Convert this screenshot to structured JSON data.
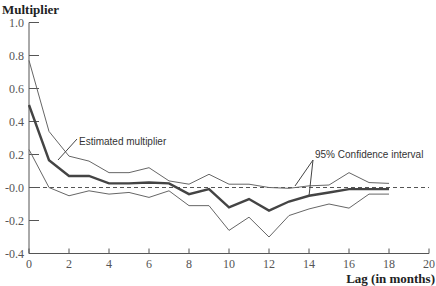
{
  "chart_data": {
    "type": "line",
    "title": "",
    "ylabel": "Multiplier",
    "xlabel": "Lag (in months)",
    "xlim": [
      0,
      20
    ],
    "ylim": [
      -0.4,
      1.0
    ],
    "x_ticks": [
      0,
      2,
      4,
      6,
      8,
      10,
      12,
      14,
      16,
      18,
      20
    ],
    "y_ticks": [
      "1.0",
      "0.8",
      "0.6",
      "0.4",
      "0.2",
      "-0.0",
      "-0.2",
      "-0.4"
    ],
    "grid": false,
    "reference_line": {
      "y": 0.0,
      "style": "dashed"
    },
    "x": [
      0,
      1,
      2,
      3,
      4,
      5,
      6,
      7,
      8,
      9,
      10,
      11,
      12,
      13,
      14,
      15,
      16,
      17,
      18
    ],
    "series": [
      {
        "name": "Estimated multiplier",
        "style": "thick",
        "values": [
          0.5,
          0.165,
          0.07,
          0.07,
          0.025,
          0.025,
          0.03,
          0.025,
          -0.04,
          -0.01,
          -0.12,
          -0.07,
          -0.14,
          -0.085,
          -0.05,
          -0.03,
          -0.01,
          -0.01,
          -0.01
        ]
      },
      {
        "name": "95% Confidence interval (upper)",
        "style": "thin",
        "values": [
          0.77,
          0.34,
          0.19,
          0.16,
          0.09,
          0.09,
          0.12,
          0.04,
          0.02,
          0.08,
          0.02,
          0.02,
          0.0,
          -0.005,
          0.01,
          0.015,
          0.09,
          0.03,
          0.025
        ]
      },
      {
        "name": "95% Confidence interval (lower)",
        "style": "thin",
        "values": [
          0.23,
          0.0,
          -0.05,
          -0.02,
          -0.04,
          -0.03,
          -0.06,
          -0.02,
          -0.11,
          -0.11,
          -0.26,
          -0.18,
          -0.3,
          -0.17,
          -0.13,
          -0.1,
          -0.125,
          -0.04,
          -0.04
        ]
      }
    ],
    "annotations": [
      {
        "text": "Estimated multiplier",
        "points_to": "Estimated multiplier"
      },
      {
        "text": "95% Confidence interval",
        "points_to": "95% Confidence interval"
      }
    ]
  },
  "labels": {
    "ylabel": "Multiplier",
    "xlabel": "Lag (in months)",
    "ann_est": "Estimated multiplier",
    "ann_ci": "95% Confidence interval"
  }
}
